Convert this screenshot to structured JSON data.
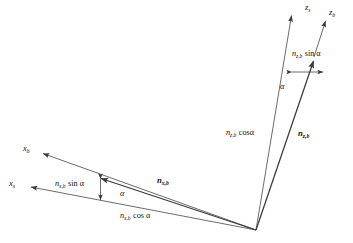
{
  "figure": {
    "type": "vector-decomposition-diagram",
    "background_color": "#ffffff",
    "stroke_color": "#3a3a3a",
    "text_color": "#111111",
    "width": 353,
    "height": 243
  },
  "origin": {
    "label": "origin",
    "x": 256,
    "y": 230
  },
  "axes": [
    {
      "name": "z-stability-axis",
      "symbol": "z",
      "subscript": "s",
      "label_x": 307,
      "label_y": 4,
      "style": "solid",
      "from": [
        256,
        230
      ],
      "to": [
        291,
        14
      ]
    },
    {
      "name": "z-body-axis",
      "symbol": "z",
      "subscript": "b",
      "label_x": 331,
      "label_y": 9,
      "style": "solid",
      "from": [
        313,
        60
      ],
      "to": [
        325,
        20
      ]
    },
    {
      "name": "x-body-axis",
      "symbol": "x",
      "subscript": "b",
      "label_x": 24,
      "label_y": 145,
      "style": "solid",
      "from": [
        256,
        230
      ],
      "to": [
        42,
        153
      ]
    },
    {
      "name": "x-stability-axis",
      "symbol": "x",
      "subscript": "s",
      "label_x": 10,
      "label_y": 180,
      "style": "solid",
      "from": [
        256,
        230
      ],
      "to": [
        30,
        187
      ]
    }
  ],
  "vectors": [
    {
      "name": "n-z-b-vector",
      "symbol": "n",
      "subscript": "z,b",
      "bold": true,
      "label_x": 299,
      "label_y": 131,
      "from": [
        256,
        230
      ],
      "to": [
        313,
        60
      ]
    },
    {
      "name": "n-x-b-vector",
      "symbol": "n",
      "subscript": "x,b",
      "bold": true,
      "label_x": 158,
      "label_y": 177,
      "from": [
        256,
        230
      ],
      "to": [
        100,
        178
      ]
    }
  ],
  "components": [
    {
      "name": "n-z-b-sin-alpha",
      "symbol": "n",
      "subscript": "z,b",
      "func": "sin",
      "angle": "α",
      "text": "sin α",
      "label_x": 293,
      "label_y": 52,
      "from": [
        291,
        72
      ],
      "to": [
        324,
        72
      ]
    },
    {
      "name": "n-z-b-cos-alpha",
      "symbol": "n",
      "subscript": "z,b",
      "func": "cos",
      "angle": "α",
      "text": "cosα",
      "label_x": 228,
      "label_y": 131,
      "from": [
        256,
        230
      ],
      "to": [
        291,
        72
      ]
    },
    {
      "name": "n-x-b-sin-alpha",
      "symbol": "n",
      "subscript": "x,b",
      "func": "sin",
      "angle": "α",
      "text": "sin α",
      "label_x": 57,
      "label_y": 181,
      "from": [
        100,
        178
      ],
      "to": [
        100,
        200
      ]
    },
    {
      "name": "n-x-b-cos-alpha",
      "symbol": "n",
      "subscript": "x,b",
      "func": "cos",
      "angle": "α",
      "text": "cos α",
      "label_x": 122,
      "label_y": 213,
      "from": [
        256,
        230
      ],
      "to": [
        100,
        200
      ]
    }
  ],
  "angles": [
    {
      "name": "alpha-angle-right",
      "symbol": "α",
      "label_x": 281,
      "label_y": 86,
      "at_vertex": [
        256,
        230
      ],
      "between": [
        "z-stability-axis",
        "n-z-b-vector"
      ]
    },
    {
      "name": "alpha-angle-left",
      "symbol": "α",
      "label_x": 121,
      "label_y": 192,
      "at_vertex": [
        256,
        230
      ],
      "between": [
        "x-stability-axis",
        "n-x-b-vector"
      ]
    }
  ]
}
